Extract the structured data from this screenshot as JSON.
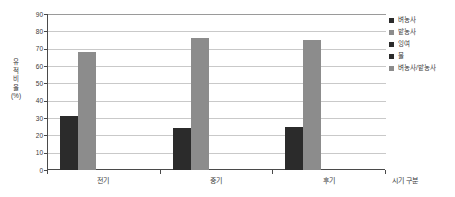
{
  "chart_data": {
    "type": "bar",
    "title": "",
    "subtitle": "",
    "xlabel": "시기 구분",
    "ylabel": "유적 비율 (%)",
    "ylabel_chars": [
      "유",
      "적",
      "비",
      "율",
      "(%)"
    ],
    "categories": [
      "전기",
      "중기",
      "후기"
    ],
    "series": [
      {
        "name": "벼농사",
        "color": "#2b2b2b",
        "values": [
          31,
          24,
          25
        ]
      },
      {
        "name": "밭농사",
        "color": "#8c8c8c",
        "values": [
          68,
          76,
          75
        ]
      },
      {
        "name": "잉여",
        "color": "#2b2b2b",
        "values": [
          0,
          0,
          0
        ]
      },
      {
        "name": "물",
        "color": "#2b2b2b",
        "values": [
          0,
          0,
          0
        ]
      },
      {
        "name": "벼농사/밭농사",
        "color": "#8c8c8c",
        "values": [
          0,
          0,
          0
        ]
      }
    ],
    "ylim": [
      0,
      90
    ],
    "ytick_values": [
      90,
      80,
      70,
      60,
      50,
      40,
      30,
      20,
      10,
      0
    ],
    "ytick_labels": [
      "90",
      "80",
      "70",
      "60",
      "50",
      "40",
      "30",
      "20",
      "10",
      "0"
    ],
    "grid": true,
    "legend_position": "right",
    "plot_background": "#ffffff",
    "gridline_color": "#c9c9c9",
    "axis_color": "#4a4a4a"
  },
  "legend": {
    "items": [
      {
        "label": "벼농사",
        "color": "#2b2b2b"
      },
      {
        "label": "밭농사",
        "color": "#8c8c8c"
      },
      {
        "label": "잉여",
        "color": "#2b2b2b"
      },
      {
        "label": "물",
        "color": "#2b2b2b"
      },
      {
        "label": "벼농사/밭농사",
        "color": "#8c8c8c"
      }
    ]
  }
}
